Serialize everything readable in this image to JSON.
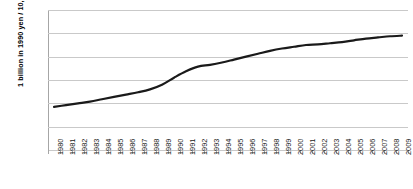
{
  "chart_data": {
    "type": "line",
    "title": "",
    "xlabel": "",
    "ylabel": "1 billion  in 1990 yen / 10,000 people",
    "ylim": [
      0,
      120
    ],
    "yticks": [
      0,
      20,
      40,
      60,
      80,
      100,
      120
    ],
    "grid": true,
    "legend": "none",
    "line_color": "#1a1a1a",
    "gridline_color": "#c9c9c9",
    "axis_color": "#a6a6a6",
    "categories": [
      "1980",
      "1981",
      "1982",
      "1983",
      "1984",
      "1985",
      "1986",
      "1987",
      "1988",
      "1989",
      "1990",
      "1991",
      "1992",
      "1993",
      "1994",
      "1995",
      "1996",
      "1997",
      "1998",
      "1999",
      "2000",
      "2001",
      "2002",
      "2003",
      "2004",
      "2005",
      "2006",
      "2007",
      "2008",
      "2009"
    ],
    "values": [
      37,
      38.5,
      40,
      41.5,
      43.5,
      45.5,
      47.5,
      49.5,
      52,
      56,
      62,
      67.5,
      71.5,
      73,
      75,
      77.5,
      80,
      82.5,
      85,
      87,
      88.5,
      90,
      90.5,
      91.5,
      92.5,
      94,
      95.5,
      96.5,
      97.5,
      98
    ],
    "series": [
      {
        "name": "",
        "values": [
          37,
          38.5,
          40,
          41.5,
          43.5,
          45.5,
          47.5,
          49.5,
          52,
          56,
          62,
          67.5,
          71.5,
          73,
          75,
          77.5,
          80,
          82.5,
          85,
          87,
          88.5,
          90,
          90.5,
          91.5,
          92.5,
          94,
          95.5,
          96.5,
          97.5,
          98
        ]
      }
    ]
  }
}
